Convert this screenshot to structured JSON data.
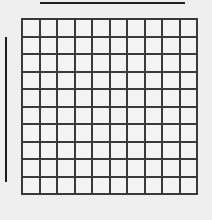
{
  "figure": {
    "background_color": "#efefef",
    "width": 212,
    "height": 220,
    "title": ""
  },
  "chart_data": {
    "type": "heatmap",
    "title": "",
    "subtitle": "",
    "xlabel": "",
    "ylabel": "",
    "grid": true,
    "legend": "none",
    "rows": 10,
    "columns": 10,
    "cell_fill_color": "#f4f4f4",
    "grid_line_color": "#3a3a3a",
    "grid_line_width": 2,
    "cell_size": 15.5,
    "x_tick_labels": [],
    "y_tick_labels": [],
    "values": [
      [
        0,
        0,
        0,
        0,
        0,
        0,
        0,
        0,
        0,
        0
      ],
      [
        0,
        0,
        0,
        0,
        0,
        0,
        0,
        0,
        0,
        0
      ],
      [
        0,
        0,
        0,
        0,
        0,
        0,
        0,
        0,
        0,
        0
      ],
      [
        0,
        0,
        0,
        0,
        0,
        0,
        0,
        0,
        0,
        0
      ],
      [
        0,
        0,
        0,
        0,
        0,
        0,
        0,
        0,
        0,
        0
      ],
      [
        0,
        0,
        0,
        0,
        0,
        0,
        0,
        0,
        0,
        0
      ],
      [
        0,
        0,
        0,
        0,
        0,
        0,
        0,
        0,
        0,
        0
      ],
      [
        0,
        0,
        0,
        0,
        0,
        0,
        0,
        0,
        0,
        0
      ],
      [
        0,
        0,
        0,
        0,
        0,
        0,
        0,
        0,
        0,
        0
      ],
      [
        0,
        0,
        0,
        0,
        0,
        0,
        0,
        0,
        0,
        0
      ]
    ]
  },
  "annotations": {
    "horizontal_bar": {
      "label": "",
      "color": "#1c1c1c",
      "x_start": 40,
      "x_end": 185,
      "y": 2,
      "thickness": 2,
      "orientation": "horizontal"
    },
    "vertical_bar": {
      "label": "",
      "color": "#1c1c1c",
      "x": 5,
      "y_start": 37,
      "y_end": 182,
      "thickness": 2,
      "orientation": "vertical"
    }
  }
}
